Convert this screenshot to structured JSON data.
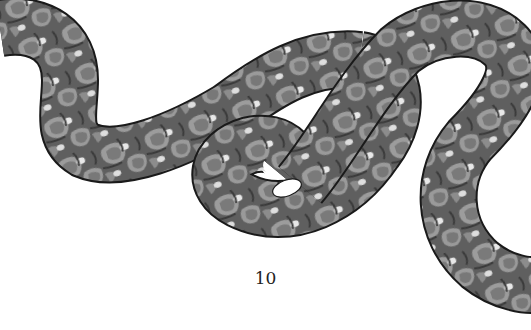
{
  "page": {
    "page_number": "10",
    "illustration": {
      "subject": "snake",
      "style": "grayscale engraving with patterned scales",
      "colors": {
        "outline": "#1a1a1a",
        "body_base": "#6f6f6f",
        "blotch_ring": "#9a9a9a",
        "blotch_fill": "#7d7d7d",
        "dark_band": "#3c3c3c",
        "highlight_spot": "#e6e6e6"
      }
    }
  }
}
